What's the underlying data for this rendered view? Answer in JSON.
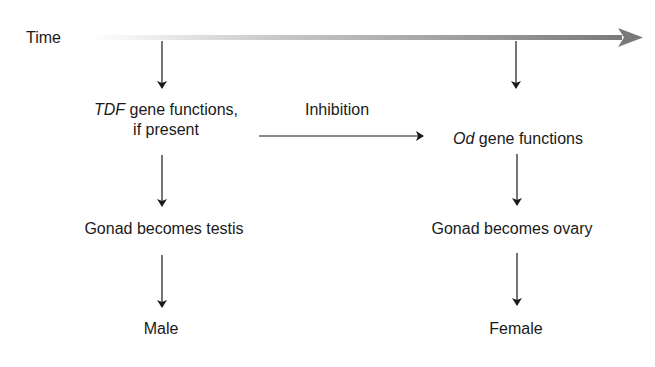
{
  "diagram": {
    "time_axis": {
      "label": "Time",
      "gradient_start": "#ffffff",
      "gradient_end": "#7a7a7a"
    },
    "left_column": {
      "gene": {
        "italic": "TDF",
        "rest": " gene functions,",
        "line2": "if present"
      },
      "gonad": "Gonad becomes testis",
      "outcome": "Male"
    },
    "right_column": {
      "gene": {
        "italic": "Od",
        "rest": " gene functions"
      },
      "gonad": "Gonad becomes ovary",
      "outcome": "Female"
    },
    "link": {
      "label": "Inhibition"
    }
  }
}
